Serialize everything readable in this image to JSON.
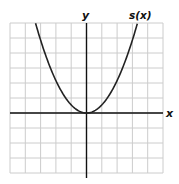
{
  "chart_data": {
    "type": "line",
    "title": "",
    "xlabel": "x",
    "ylabel": "y",
    "xlim": [
      -5,
      5
    ],
    "ylim": [
      -4,
      6
    ],
    "grid": true,
    "grid_color": "#cccccc",
    "axis_color": "#111111",
    "series": [
      {
        "name": "s(x)",
        "color": "#222222",
        "function": "a*x^2, a≈0.54 (parabola, vertex at origin, opens upward)",
        "x": [
          -3.33,
          -3,
          -2.5,
          -2,
          -1.5,
          -1,
          -0.5,
          0,
          0.5,
          1,
          1.5,
          2,
          2.5,
          3,
          3.33
        ],
        "y": [
          6.0,
          4.86,
          3.38,
          2.16,
          1.22,
          0.54,
          0.14,
          0,
          0.14,
          0.54,
          1.22,
          2.16,
          3.38,
          4.86,
          6.0
        ]
      }
    ],
    "legend": [],
    "annotations": [
      {
        "text": "s(x)",
        "position": "top-right, near curve end"
      }
    ]
  },
  "labels": {
    "x_axis": "x",
    "y_axis": "y",
    "curve": "s(x)"
  }
}
